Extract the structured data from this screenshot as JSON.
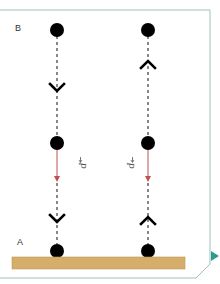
{
  "diagram": {
    "labels": {
      "top_point": "B",
      "bottom_point": "A",
      "force_left": "P",
      "force_right": "P"
    },
    "colors": {
      "frame": "#9fbfb8",
      "ball": "#000000",
      "force_arrow": "#c0504d",
      "ground": "#d4ae6a",
      "ground_border": "#c29a52",
      "nav_arrow": "#2a9d8f"
    },
    "columns": [
      {
        "id": "left",
        "motion_direction": "down",
        "chevron_upper": "down",
        "chevron_lower": "down",
        "force_label": "P"
      },
      {
        "id": "right",
        "motion_direction": "up",
        "chevron_upper": "up",
        "chevron_lower": "up",
        "force_label": "P"
      }
    ],
    "nav": {
      "next_icon": "play-triangle-icon"
    }
  }
}
